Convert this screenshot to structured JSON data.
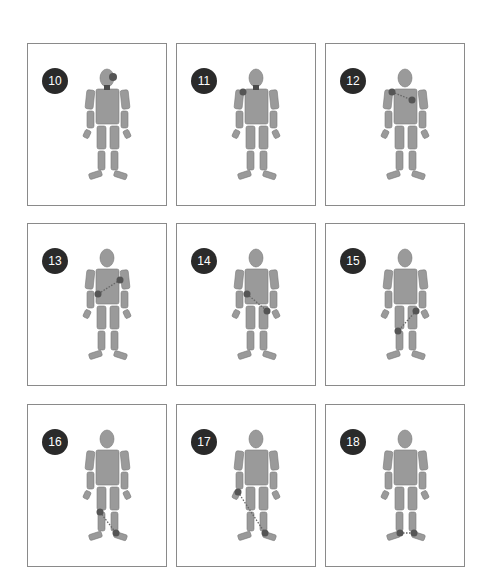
{
  "figure": {
    "body_color": "#9a9a9a",
    "body_stroke": "#7a7a7a",
    "marker_color": "#555555",
    "dot_line_color": "#666666"
  },
  "panels": [
    {
      "number": "10",
      "markers": [
        {
          "x": 85,
          "y": 33,
          "r": 4
        }
      ],
      "lines": [],
      "head_patch": true
    },
    {
      "number": "11",
      "markers": [
        {
          "x": 66,
          "y": 48,
          "r": 3.5
        }
      ],
      "lines": [],
      "head_patch": true
    },
    {
      "number": "12",
      "markers": [
        {
          "x": 66,
          "y": 48,
          "r": 3.5
        },
        {
          "x": 86,
          "y": 56,
          "r": 3.5
        }
      ],
      "lines": [
        [
          66,
          48,
          86,
          56
        ]
      ],
      "head_patch": false
    },
    {
      "number": "13",
      "markers": [
        {
          "x": 92,
          "y": 56,
          "r": 3.5
        },
        {
          "x": 70,
          "y": 70,
          "r": 3.5
        }
      ],
      "lines": [
        [
          92,
          56,
          70,
          70
        ]
      ],
      "head_patch": false
    },
    {
      "number": "14",
      "markers": [
        {
          "x": 70,
          "y": 70,
          "r": 3.5
        },
        {
          "x": 90,
          "y": 87,
          "r": 3.5
        }
      ],
      "lines": [
        [
          70,
          70,
          90,
          87
        ]
      ],
      "head_patch": false
    },
    {
      "number": "15",
      "markers": [
        {
          "x": 90,
          "y": 87,
          "r": 3.5
        },
        {
          "x": 72,
          "y": 107,
          "r": 3.5
        }
      ],
      "lines": [
        [
          90,
          87,
          72,
          107
        ]
      ],
      "head_patch": false
    },
    {
      "number": "16",
      "markers": [
        {
          "x": 72,
          "y": 107,
          "r": 3.5
        },
        {
          "x": 88,
          "y": 128,
          "r": 3.5
        }
      ],
      "lines": [
        [
          72,
          107,
          88,
          128
        ]
      ],
      "head_patch": false
    },
    {
      "number": "17",
      "markers": [
        {
          "x": 61,
          "y": 87,
          "r": 3.5
        },
        {
          "x": 88,
          "y": 128,
          "r": 3.5
        }
      ],
      "lines": [
        [
          61,
          87,
          88,
          128
        ]
      ],
      "head_patch": false
    },
    {
      "number": "18",
      "markers": [
        {
          "x": 74,
          "y": 128,
          "r": 3.5
        },
        {
          "x": 88,
          "y": 128,
          "r": 3.5
        }
      ],
      "lines": [
        [
          74,
          128,
          88,
          128
        ]
      ],
      "head_patch": false
    }
  ]
}
